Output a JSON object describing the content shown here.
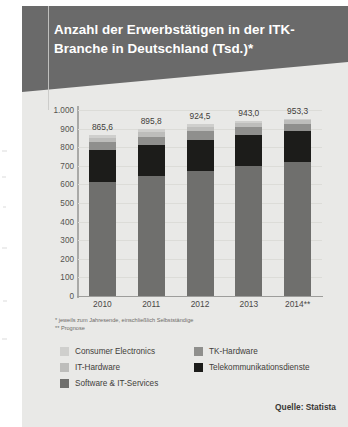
{
  "title": "Anzahl der Erwerbstätigen in der ITK-Branche in Deutschland (Tsd.)*",
  "footnotes": {
    "line1": "* jeweils zum Jahresende, einschließlich Selbstständige",
    "line2": "** Prognose"
  },
  "source": "Quelle: Statista",
  "colors": {
    "banner": "#6a6a6a",
    "card": "#e9e9e7",
    "consumer_electronics": "#cfcfcd",
    "it_hardware": "#bdbdbb",
    "software_it_services": "#6f6f6d",
    "tk_hardware": "#8f8f8d",
    "telekommunikationsdienste": "#1c1c1a"
  },
  "chart_data": {
    "type": "bar",
    "title": "Anzahl der Erwerbstätigen in der ITK-Branche in Deutschland (Tsd.)*",
    "xlabel": "",
    "ylabel": "",
    "ylim": [
      0,
      1000
    ],
    "ytick_labels": [
      "1.000",
      "900",
      "800",
      "700",
      "600",
      "500",
      "400",
      "300",
      "200",
      "100",
      "0"
    ],
    "ytick_values": [
      1000,
      900,
      800,
      700,
      600,
      500,
      400,
      300,
      200,
      100,
      0
    ],
    "grid": true,
    "stacked": true,
    "legend_position": "bottom",
    "categories": [
      "2010",
      "2011",
      "2012",
      "2013",
      "2014**"
    ],
    "totals": [
      "865,6",
      "895,8",
      "924,5",
      "943,0",
      "953,3"
    ],
    "total_values": [
      865.6,
      895.8,
      924.5,
      943.0,
      953.3
    ],
    "series": [
      {
        "name": "Software & IT-Services",
        "color": "#6f6f6d",
        "values": [
          615.0,
          645.0,
          672.0,
          700.0,
          720.0
        ]
      },
      {
        "name": "Telekommunikationsdienste",
        "color": "#1c1c1a",
        "values": [
          168.0,
          167.0,
          166.0,
          167.0,
          165.0
        ]
      },
      {
        "name": "TK-Hardware",
        "color": "#8f8f8d",
        "values": [
          44.0,
          45.0,
          47.0,
          43.0,
          41.0
        ]
      },
      {
        "name": "IT-Hardware",
        "color": "#bdbdbb",
        "values": [
          22.6,
          22.8,
          23.5,
          21.0,
          18.3
        ]
      },
      {
        "name": "Consumer Electronics",
        "color": "#cfcfcd",
        "values": [
          16.0,
          16.0,
          16.0,
          12.0,
          9.0
        ]
      }
    ]
  },
  "legend": [
    {
      "label": "Consumer Electronics",
      "color": "#cfcfcd"
    },
    {
      "label": "TK-Hardware",
      "color": "#8f8f8d"
    },
    {
      "label": "IT-Hardware",
      "color": "#bdbdbb"
    },
    {
      "label": "Telekommunikationsdienste",
      "color": "#1c1c1a"
    },
    {
      "label": "Software & IT-Services",
      "color": "#6f6f6d"
    }
  ]
}
